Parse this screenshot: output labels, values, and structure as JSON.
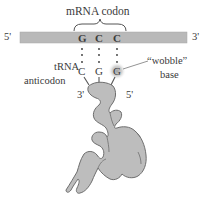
{
  "figure": {
    "title": "mRNA codon",
    "mrna": {
      "left_end": "5'",
      "right_end": "3'",
      "codon": [
        "G",
        "C",
        "C"
      ],
      "bar_color": "#b9b9b9"
    },
    "trna": {
      "label_line1": "tRNA",
      "label_line2": "anticodon",
      "anticodon": [
        "C",
        "G",
        "G"
      ],
      "left_end": "3'",
      "right_end": "5'",
      "body_color": "#bdbdbd",
      "outline_color": "#6e6e6e"
    },
    "wobble": {
      "label_line1": "“wobble”",
      "label_line2": "base",
      "highlight_color": "#9a9a9a"
    }
  }
}
